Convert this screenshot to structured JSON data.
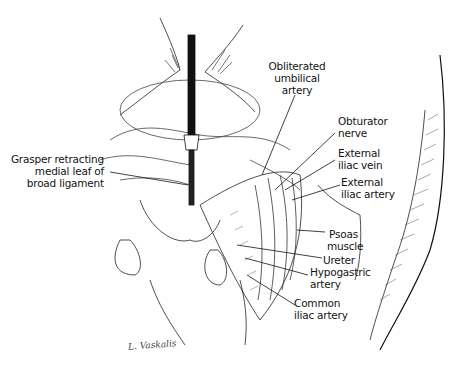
{
  "figure": {
    "type": "surgical anatomical illustration",
    "labels": [
      {
        "id": "obliterated-umbilical-artery",
        "lines": [
          "Obliterated",
          "umbilical",
          "artery"
        ]
      },
      {
        "id": "obturator-nerve",
        "lines": [
          "Obturator",
          "nerve"
        ]
      },
      {
        "id": "external-iliac-vein",
        "lines": [
          "External",
          "iliac vein"
        ]
      },
      {
        "id": "external-iliac-artery",
        "lines": [
          "External",
          "iliac artery"
        ]
      },
      {
        "id": "grasper",
        "lines": [
          "Grasper retracting",
          "medial leaf of",
          "broad ligament"
        ]
      },
      {
        "id": "psoas-muscle",
        "lines": [
          "Psoas",
          "muscle"
        ]
      },
      {
        "id": "ureter",
        "lines": [
          "Ureter"
        ]
      },
      {
        "id": "hypogastric-artery",
        "lines": [
          "Hypogastric",
          "artery"
        ]
      },
      {
        "id": "common-iliac-artery",
        "lines": [
          "Common",
          "iliac artery"
        ]
      }
    ],
    "signature": "L. Vaskalis"
  },
  "colors": {
    "ink": "#141414",
    "background": "#ffffff",
    "hatch": "#555555"
  }
}
